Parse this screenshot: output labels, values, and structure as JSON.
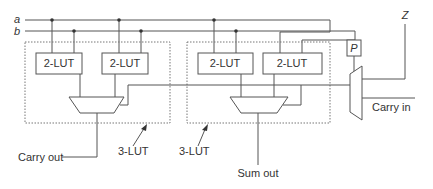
{
  "diagram": {
    "inputs": {
      "a": "a",
      "b": "b"
    },
    "left_block": {
      "lut1": "2-LUT",
      "lut2": "2-LUT",
      "label": "3-LUT",
      "output": "Carry out"
    },
    "right_block": {
      "lut1": "2-LUT",
      "lut2": "2-LUT",
      "label": "3-LUT",
      "output": "Sum out"
    },
    "output_mux": {
      "select": "P",
      "output": "Z",
      "carry_input": "Carry in"
    },
    "colors": {
      "line": "#555555",
      "text": "#333333",
      "background": "#ffffff"
    }
  }
}
